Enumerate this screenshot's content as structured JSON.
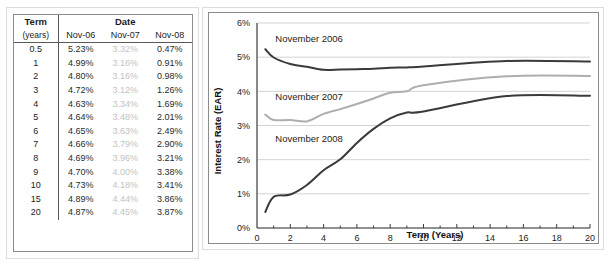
{
  "table": {
    "header": {
      "term_label": "Term",
      "term_sub_label": "(years)",
      "date_label": "Date",
      "date_columns": [
        "Nov-06",
        "Nov-07",
        "Nov-08"
      ]
    },
    "terms": [
      "0.5",
      "1",
      "2",
      "3",
      "4",
      "5",
      "6",
      "7",
      "8",
      "9",
      "10",
      "15",
      "20"
    ],
    "rows": [
      {
        "term": "0.5",
        "values": [
          "5.23%",
          "3.32%",
          "0.47%"
        ]
      },
      {
        "term": "1",
        "values": [
          "4.99%",
          "3.16%",
          "0.91%"
        ]
      },
      {
        "term": "2",
        "values": [
          "4.80%",
          "3.16%",
          "0.98%"
        ]
      },
      {
        "term": "3",
        "values": [
          "4.72%",
          "3.12%",
          "1.26%"
        ]
      },
      {
        "term": "4",
        "values": [
          "4.63%",
          "3.34%",
          "1.69%"
        ]
      },
      {
        "term": "5",
        "values": [
          "4.64%",
          "3.48%",
          "2.01%"
        ]
      },
      {
        "term": "6",
        "values": [
          "4.65%",
          "3.63%",
          "2.49%"
        ]
      },
      {
        "term": "7",
        "values": [
          "4.66%",
          "3.79%",
          "2.90%"
        ]
      },
      {
        "term": "8",
        "values": [
          "4.69%",
          "3.96%",
          "3.21%"
        ]
      },
      {
        "term": "9",
        "values": [
          "4.70%",
          "4.00%",
          "3.38%"
        ]
      },
      {
        "term": "10",
        "values": [
          "4.73%",
          "4.18%",
          "3.41%"
        ]
      },
      {
        "term": "15",
        "values": [
          "4.89%",
          "4.44%",
          "3.86%"
        ]
      },
      {
        "term": "20",
        "values": [
          "4.87%",
          "4.45%",
          "3.87%"
        ]
      }
    ],
    "column_colors": [
      "#2a2a2a",
      "#c2c2c2",
      "#2a2a2a"
    ]
  },
  "chart_data": {
    "type": "line",
    "title": "",
    "xlabel": "Term (Years)",
    "ylabel": "Interest Rate (EAR)",
    "xlim": [
      0,
      20
    ],
    "ylim": [
      0,
      6
    ],
    "xticks": [
      0,
      2,
      4,
      6,
      8,
      10,
      12,
      14,
      16,
      18,
      20
    ],
    "xtick_labels": [
      "0",
      "2",
      "4",
      "6",
      "8",
      "10",
      "12",
      "14",
      "16",
      "18",
      "20"
    ],
    "xticks_minor": [
      1,
      3,
      5,
      7,
      9,
      11,
      13,
      15,
      17,
      19
    ],
    "yticks": [
      0,
      1,
      2,
      3,
      4,
      5,
      6
    ],
    "ytick_labels": [
      "0%",
      "1%",
      "2%",
      "3%",
      "4%",
      "5%",
      "6%"
    ],
    "grid": "horizontal",
    "legend_position": "inline-annotations",
    "x": [
      0.5,
      1,
      2,
      3,
      4,
      5,
      6,
      7,
      8,
      9,
      10,
      15,
      20
    ],
    "series": [
      {
        "name": "November 2006",
        "label": "November 2006",
        "color": "#3a3a3a",
        "line_width": 2.0,
        "values": [
          5.23,
          4.99,
          4.8,
          4.72,
          4.63,
          4.64,
          4.65,
          4.66,
          4.69,
          4.7,
          4.73,
          4.89,
          4.87
        ],
        "annotation": {
          "text": "November 2006",
          "x": 1.1,
          "y": 5.45
        }
      },
      {
        "name": "November 2007",
        "label": "November 2007",
        "color": "#aeaeae",
        "line_width": 2.0,
        "values": [
          3.32,
          3.16,
          3.16,
          3.12,
          3.34,
          3.48,
          3.63,
          3.79,
          3.96,
          4.0,
          4.18,
          4.44,
          4.45
        ],
        "annotation": {
          "text": "November 2007",
          "x": 1.1,
          "y": 3.74
        }
      },
      {
        "name": "November 2008",
        "label": "November 2008",
        "color": "#3a3a3a",
        "line_width": 2.0,
        "values": [
          0.47,
          0.91,
          0.98,
          1.26,
          1.69,
          2.01,
          2.49,
          2.9,
          3.21,
          3.38,
          3.41,
          3.86,
          3.87
        ],
        "annotation": {
          "text": "November 2008",
          "x": 1.1,
          "y": 2.52
        }
      }
    ]
  }
}
